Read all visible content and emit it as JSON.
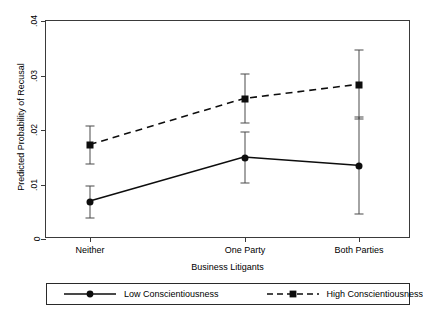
{
  "chart_data": {
    "type": "line",
    "title": "",
    "xlabel": "Business Litigants",
    "ylabel": "Predicted Probability of Recusal",
    "categories": [
      "Neither",
      "One Party",
      "Both Parties"
    ],
    "ytick_labels": [
      "0",
      ".01",
      ".02",
      ".03",
      ".04"
    ],
    "ytick_values": [
      0,
      0.01,
      0.02,
      0.03,
      0.04
    ],
    "ylim": [
      0,
      0.04
    ],
    "grid": false,
    "legend_position": "bottom",
    "error_bars": "95% confidence interval",
    "series": [
      {
        "name": "Low Conscientiousness",
        "marker": "circle",
        "linestyle": "solid",
        "color": "#0d0d0d",
        "values": [
          0.0068,
          0.0149,
          0.0134
        ],
        "ci_low": [
          0.0039,
          0.0103,
          0.0046
        ],
        "ci_high": [
          0.0098,
          0.0196,
          0.0223
        ]
      },
      {
        "name": "High Conscientiousness",
        "marker": "square",
        "linestyle": "dashed",
        "color": "#0d0d0d",
        "values": [
          0.0172,
          0.0257,
          0.0283
        ],
        "ci_low": [
          0.0137,
          0.0213,
          0.022
        ],
        "ci_high": [
          0.0207,
          0.0302,
          0.0347
        ]
      }
    ]
  },
  "legend": {
    "items": [
      {
        "label": "Low Conscientiousness"
      },
      {
        "label": "High Conscientiousness"
      }
    ]
  }
}
